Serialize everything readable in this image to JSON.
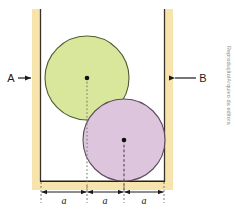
{
  "figure": {
    "labels": {
      "left_wall_label": "A",
      "right_wall_label": "B"
    },
    "credit_text": "Reprodução/Arquivo da editora",
    "dimension_labels": [
      "a",
      "a",
      "a"
    ],
    "colors": {
      "wall_fill": "#f7e4ac",
      "wall_edge_line": "#3a3226",
      "floor_line": "#262018",
      "green_circle_fill": "#d9e79c",
      "green_circle_stroke": "#4f5a33",
      "purple_circle_fill": "#ddc6dd",
      "purple_circle_stroke": "#5d4c5d",
      "center_dot": "#111111",
      "dimension_line": "#1a1a1a",
      "credit": "#8c8c8c",
      "background": "#ffffff"
    },
    "geometry": {
      "left_wall_x": 32,
      "left_wall_width": 9,
      "right_wall_x": 164,
      "right_wall_width": 9,
      "wall_top_y": 9,
      "floor_y": 181,
      "green_circle": {
        "cx": 87,
        "cy": 78,
        "r": 42
      },
      "purple_circle": {
        "cx": 124,
        "cy": 140,
        "r": 41
      },
      "dimension_ticks": [
        41,
        87,
        124,
        164
      ],
      "dimension_axis_y": 192
    }
  }
}
